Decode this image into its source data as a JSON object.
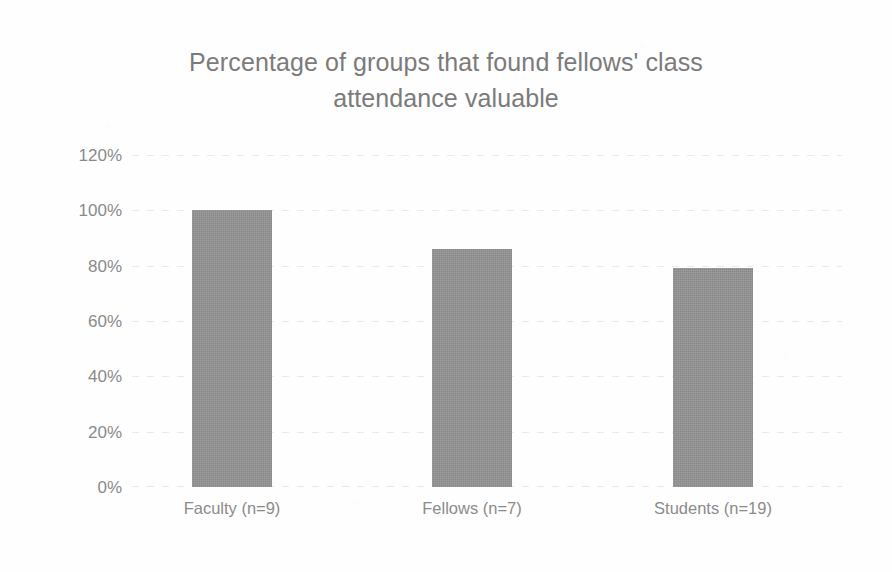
{
  "chart_data": {
    "type": "bar",
    "title": "Percentage of groups that found fellows' class\nattendance valuable",
    "title_line1": "Percentage of groups that found fellows' class",
    "title_line2": "attendance valuable",
    "xlabel": "",
    "ylabel": "",
    "categories": [
      "Faculty (n=9)",
      "Fellows (n=7)",
      "Students (n=19)"
    ],
    "values": [
      100,
      86,
      79
    ],
    "value_labels": [
      "100%",
      "86%",
      "79%"
    ],
    "ylim": [
      0,
      120
    ],
    "ytick_values": [
      120,
      100,
      80,
      60,
      40,
      20,
      0
    ],
    "ytick_labels": [
      "120%",
      "100%",
      "80%",
      "60%",
      "40%",
      "20%",
      "0%"
    ],
    "grid": true,
    "grid_axis": "y",
    "legend": false,
    "legend_position": "none",
    "series": [
      {
        "name": "Percentage of groups",
        "values": [
          100,
          86,
          79
        ],
        "color": "#939393"
      }
    ],
    "colors": {
      "bar_fill": "#939393",
      "title_text": "#7b7b7b",
      "tick_text": "#8a8a8a",
      "gridline": "#c8c8c8",
      "background": "#ffffff"
    }
  }
}
